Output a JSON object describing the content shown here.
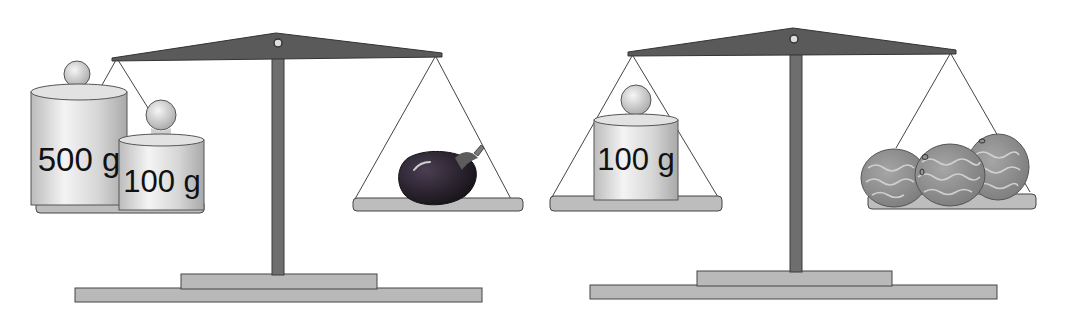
{
  "colors": {
    "beam": "#5a5a5a",
    "post": "#6e6e6e",
    "base": "#b9b9b9",
    "pan": "#bdbdbd",
    "weight": "#d9d9d9",
    "eggplant": "#2b2530",
    "melon": "#8f8f8f",
    "outline": "#333333"
  },
  "scales": [
    {
      "name": "left-scale",
      "left_pan": {
        "items": [
          {
            "type": "weight",
            "label": "500 g"
          },
          {
            "type": "weight",
            "label": "100 g"
          }
        ]
      },
      "right_pan": {
        "items": [
          {
            "type": "eggplant",
            "icon": "eggplant-icon"
          }
        ]
      }
    },
    {
      "name": "right-scale",
      "left_pan": {
        "items": [
          {
            "type": "weight",
            "label": "100 g"
          }
        ]
      },
      "right_pan": {
        "items": [
          {
            "type": "melon",
            "icon": "melon-icon"
          },
          {
            "type": "melon",
            "icon": "melon-icon"
          },
          {
            "type": "melon",
            "icon": "melon-icon"
          }
        ]
      }
    }
  ]
}
